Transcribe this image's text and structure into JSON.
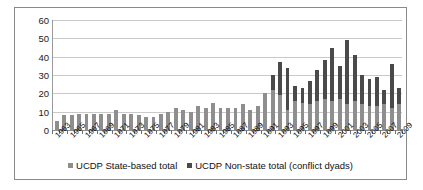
{
  "chart": {
    "title": "",
    "legend": {
      "position": "bottom",
      "items": [
        {
          "label": "UCDP State-based total",
          "color": "#8e8e8e"
        },
        {
          "label": "UCDP Non-state total (conflict dyads)",
          "color": "#4a4a4a"
        }
      ]
    },
    "axis": {
      "y_ticks": [
        "60",
        "50",
        "40",
        "30",
        "20",
        "10",
        "0"
      ],
      "x_visible_labels": [
        "1963",
        "1965",
        "1967",
        "1969",
        "1971",
        "1973",
        "1975",
        "1977",
        "1979",
        "1981",
        "1983",
        "1985",
        "1987",
        "1989",
        "1991",
        "1993",
        "1995",
        "1997",
        "1999",
        "2001",
        "2003",
        "2005",
        "2007",
        "2009"
      ]
    },
    "colors": {
      "state_based": "#8e8e8e",
      "non_state": "#4a4a4a",
      "gridline": "#c9c9c9",
      "frame": "#8a8a8a",
      "text": "#111111"
    }
  },
  "chart_data": {
    "type": "bar",
    "stacked": true,
    "title": "",
    "xlabel": "",
    "ylabel": "",
    "ylim": [
      0,
      60
    ],
    "ytick_step": 10,
    "grid": true,
    "legend_position": "bottom",
    "categories": [
      "1963",
      "1964",
      "1965",
      "1966",
      "1967",
      "1968",
      "1969",
      "1970",
      "1971",
      "1972",
      "1973",
      "1974",
      "1975",
      "1976",
      "1977",
      "1978",
      "1979",
      "1980",
      "1981",
      "1982",
      "1983",
      "1984",
      "1985",
      "1986",
      "1987",
      "1988",
      "1989",
      "1990",
      "1991",
      "1992",
      "1993",
      "1994",
      "1995",
      "1996",
      "1997",
      "1998",
      "1999",
      "2000",
      "2001",
      "2002",
      "2003",
      "2004",
      "2005",
      "2006",
      "2007",
      "2008",
      "2009"
    ],
    "series": [
      {
        "name": "UCDP State-based total",
        "color": "#8e8e8e",
        "values": [
          5,
          8,
          8,
          9,
          9,
          9,
          9,
          9,
          11,
          9,
          9,
          8,
          7,
          7,
          9,
          10,
          12,
          11,
          10,
          13,
          12,
          15,
          12,
          12,
          12,
          14,
          11,
          13,
          20,
          22,
          19,
          11,
          16,
          15,
          14,
          16,
          17,
          16,
          17,
          14,
          16,
          14,
          13,
          13,
          14,
          12,
          14
        ]
      },
      {
        "name": "UCDP Non-state total (conflict dyads)",
        "color": "#4a4a4a",
        "values": [
          0,
          0,
          0,
          0,
          0,
          0,
          0,
          0,
          0,
          0,
          0,
          0,
          0,
          0,
          0,
          0,
          0,
          0,
          0,
          0,
          0,
          0,
          0,
          0,
          0,
          0,
          0,
          0,
          0,
          8,
          18,
          23,
          8,
          8,
          13,
          17,
          21,
          29,
          18,
          35,
          25,
          16,
          15,
          16,
          8,
          24,
          9
        ]
      }
    ],
    "totals": [
      5,
      8,
      8,
      9,
      9,
      9,
      9,
      9,
      11,
      9,
      9,
      8,
      7,
      7,
      9,
      10,
      12,
      11,
      10,
      13,
      12,
      15,
      12,
      12,
      12,
      14,
      11,
      13,
      20,
      30,
      37,
      34,
      24,
      23,
      27,
      33,
      38,
      45,
      35,
      49,
      41,
      30,
      28,
      29,
      22,
      36,
      23
    ]
  }
}
